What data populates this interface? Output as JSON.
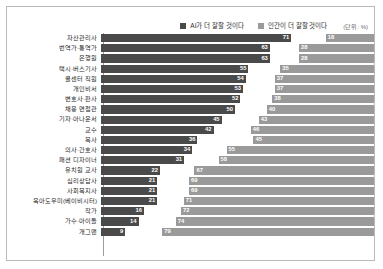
{
  "legend": {
    "ai_label": "AI가 더 잘할 것이다",
    "human_label": "인간이 더 잘할 것이다",
    "unit": "(단위: %)",
    "ai_color": "#4a4a4a",
    "human_color": "#9a9a9a"
  },
  "chart_data": {
    "type": "bar",
    "title": "",
    "subtitle": "",
    "xlabel": "",
    "ylabel": "",
    "unit": "%",
    "orientation": "horizontal",
    "layout": "diverging-paired",
    "grid": false,
    "legend_position": "top-right",
    "xlim": [
      0,
      100
    ],
    "categories": [
      "자산관리사",
      "번역가·통역가",
      "은행원",
      "택시·버스기사",
      "콜센터 직원",
      "개인비서",
      "변호사·판사",
      "채용 면접관",
      "기자·아나운서",
      "교수",
      "목사",
      "의사·간호사",
      "패션 디자이너",
      "유치원 교사",
      "심리상담사",
      "사회복지사",
      "육아도우미(베이비시터)",
      "작가",
      "가수·아이돌",
      "개그맨"
    ],
    "series": [
      {
        "name": "AI가 더 잘할 것이다",
        "color": "#4a4a4a",
        "values": [
          71,
          63,
          63,
          55,
          54,
          53,
          52,
          50,
          45,
          42,
          36,
          34,
          31,
          22,
          21,
          21,
          21,
          16,
          14,
          9
        ]
      },
      {
        "name": "인간이 더 잘할 것이다",
        "color": "#9a9a9a",
        "values": [
          18,
          28,
          28,
          35,
          37,
          37,
          38,
          40,
          43,
          46,
          45,
          55,
          58,
          67,
          69,
          69,
          71,
          72,
          74,
          79
        ]
      }
    ]
  }
}
